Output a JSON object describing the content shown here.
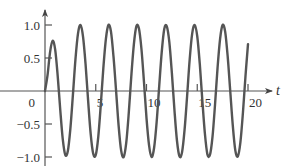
{
  "chart_data": {
    "type": "line",
    "title": "",
    "xlabel": "t",
    "ylabel": "",
    "xlim": [
      0,
      20
    ],
    "ylim": [
      -1.0,
      1.0
    ],
    "grid": false,
    "legend": null,
    "x_ticks": [
      0,
      5,
      10,
      15,
      20
    ],
    "x_tick_labels": [
      "0",
      "5",
      "10",
      "15",
      "20"
    ],
    "y_ticks": [
      1.0,
      0.5,
      -0.5,
      -1.0
    ],
    "y_tick_labels": [
      "1.0",
      "0.5",
      "−0.5",
      "−1.0"
    ],
    "series": [
      {
        "name": "response",
        "color": "#555555",
        "x": [
          0,
          0.25,
          0.5,
          0.75,
          1,
          1.25,
          1.5,
          1.75,
          2,
          2.25,
          2.5,
          2.75,
          3,
          3.25,
          3.5,
          3.75,
          4,
          4.25,
          4.5,
          4.75,
          5,
          5.25,
          5.5,
          5.75,
          6,
          6.25,
          6.5,
          6.75,
          7,
          7.25,
          7.5,
          7.75,
          8,
          8.25,
          8.5,
          8.75,
          9,
          9.25,
          9.5,
          9.75,
          10,
          10.25,
          10.5,
          10.75,
          11,
          11.25,
          11.5,
          11.75,
          12,
          12.25,
          12.5,
          12.75,
          13,
          13.25,
          13.5,
          13.75,
          14,
          14.25,
          14.5,
          14.75,
          15,
          15.25,
          15.5,
          15.75,
          16,
          16.25,
          16.5,
          16.75,
          17,
          17.25,
          17.5,
          17.75,
          18,
          18.25,
          18.5,
          18.75,
          19,
          19.25,
          19.5,
          19.75,
          20
        ],
        "y": [
          0,
          0.24,
          0.59,
          0.76,
          0.63,
          0.23,
          -0.28,
          -0.73,
          -0.97,
          -0.91,
          -0.57,
          -0.06,
          0.48,
          0.87,
          1.0,
          0.82,
          0.4,
          -0.15,
          -0.65,
          -0.95,
          -0.97,
          -0.69,
          -0.2,
          0.35,
          0.79,
          1.0,
          0.9,
          0.52,
          0.01,
          -0.52,
          -0.9,
          -1.0,
          -0.79,
          -0.34,
          0.22,
          0.7,
          0.98,
          0.95,
          0.64,
          0.14,
          -0.41,
          -0.82,
          -1.0,
          -0.86,
          -0.47,
          0.07,
          0.59,
          0.94,
          0.98,
          0.74,
          0.27,
          -0.28,
          -0.75,
          -0.99,
          -0.93,
          -0.59,
          -0.08,
          0.47,
          0.87,
          1.0,
          0.83,
          0.41,
          -0.14,
          -0.64,
          -0.96,
          -0.97,
          -0.7,
          -0.21,
          0.35,
          0.79,
          1.0,
          0.9,
          0.52,
          0.0,
          -0.52,
          -0.9,
          -0.99,
          -0.78,
          -0.33,
          0.22,
          0.71
        ]
      }
    ]
  }
}
